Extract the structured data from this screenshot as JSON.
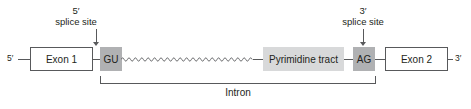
{
  "figure": {
    "background_color": "#ffffff",
    "line_color": "#58595b",
    "text_color": "#231f20",
    "dark_shade_color": "#b0b1b3",
    "light_shade_color": "#d8d9da"
  },
  "ends": {
    "left_label": "5′",
    "right_label": "3′"
  },
  "exons": [
    {
      "label": "Exon 1"
    },
    {
      "label": "Exon 2"
    }
  ],
  "motifs": [
    {
      "label": "GU",
      "shade": "dark"
    },
    {
      "label": "Pyrimidine tract",
      "shade": "light"
    },
    {
      "label": "AG",
      "shade": "dark"
    }
  ],
  "callouts": [
    {
      "line1": "5′",
      "line2": "splice site",
      "points_to": "GU"
    },
    {
      "line1": "3′",
      "line2": "splice site",
      "points_to": "AG"
    }
  ],
  "bracket": {
    "label": "Intron",
    "spans_from": "GU",
    "spans_to": "AG"
  }
}
